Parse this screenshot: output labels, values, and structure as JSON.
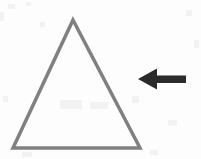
{
  "canvas": {
    "width": 201,
    "height": 159,
    "background_color": "#fdfdfd"
  },
  "figure": {
    "shapes": [
      {
        "id": "triangle",
        "name": "triangle-outline",
        "kind": "triangle",
        "stroke_color": "#808080",
        "fill_color": "none",
        "stroke_width": 3.5,
        "points": "73,20 140,148 13,148",
        "vertices": {
          "apex": [
            73,
            20
          ],
          "bottom_left": [
            13,
            148
          ],
          "bottom_right": [
            140,
            148
          ]
        }
      },
      {
        "id": "arrow",
        "name": "arrow-left",
        "kind": "arrow",
        "direction": "left",
        "fill_color": "#2b2b2b",
        "stroke_color": "none",
        "path": "M 138,79 L 157,68.5 L 157,75.5 L 186,75.5 L 186,83.0 L 157,83.0 L 157,89.5 Z",
        "tip": [
          138,
          79
        ],
        "tail": [
          186,
          79
        ],
        "head_height": 21,
        "shaft_thickness": 7.5
      }
    ]
  },
  "colors": {
    "triangle_stroke": "#808080",
    "arrow_fill": "#2b2b2b",
    "background": "#fdfdfd"
  }
}
